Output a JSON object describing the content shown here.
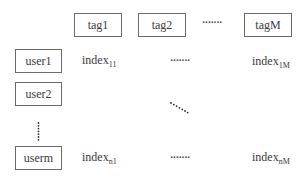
{
  "tags": [
    {
      "label": "tag1"
    },
    {
      "label": "tag2"
    },
    {
      "label": "tagM"
    }
  ],
  "tag_ellipsis": "·······",
  "users": [
    {
      "label": "user1"
    },
    {
      "label": "user2"
    },
    {
      "label": "userm"
    }
  ],
  "cells": {
    "r1c1": {
      "base": "index",
      "sub": "11"
    },
    "r1cM": {
      "base": "index",
      "sub": "1M"
    },
    "rnc1": {
      "base": "index",
      "sub": "n1"
    },
    "rncM": {
      "base": "index",
      "sub": "nM"
    }
  },
  "row1_ellipsis": "·······",
  "rown_ellipsis": "·······"
}
